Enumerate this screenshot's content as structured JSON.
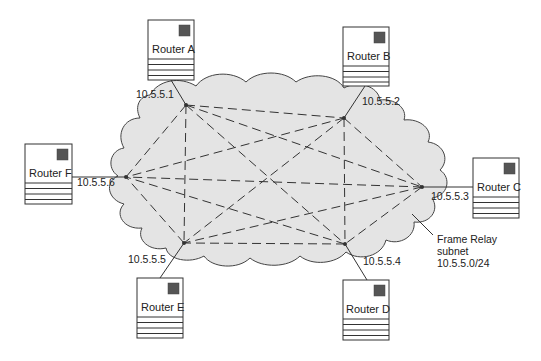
{
  "diagram": {
    "type": "frame-relay-full-mesh",
    "colors": {
      "cloud_fill": "#e4e4e4",
      "line": "#333333",
      "router_led": "#555555",
      "background": "#ffffff"
    },
    "cloud": {
      "label_line1": "Frame Relay",
      "label_line2": "subnet",
      "label_line3": "10.5.5.0/24"
    },
    "routers": [
      {
        "id": "A",
        "name": "Router A",
        "ip": "10.5.5.1"
      },
      {
        "id": "B",
        "name": "Router B",
        "ip": "10.5.5.2"
      },
      {
        "id": "C",
        "name": "Router C",
        "ip": "10.5.5.3"
      },
      {
        "id": "D",
        "name": "Router D",
        "ip": "10.5.5.4"
      },
      {
        "id": "E",
        "name": "Router E",
        "ip": "10.5.5.5"
      },
      {
        "id": "F",
        "name": "Router F",
        "ip": "10.5.5.6"
      }
    ],
    "pvcs": [
      [
        "A",
        "B"
      ],
      [
        "A",
        "C"
      ],
      [
        "A",
        "D"
      ],
      [
        "A",
        "E"
      ],
      [
        "A",
        "F"
      ],
      [
        "B",
        "C"
      ],
      [
        "B",
        "D"
      ],
      [
        "B",
        "E"
      ],
      [
        "B",
        "F"
      ],
      [
        "C",
        "D"
      ],
      [
        "C",
        "E"
      ],
      [
        "C",
        "F"
      ],
      [
        "D",
        "E"
      ],
      [
        "D",
        "F"
      ],
      [
        "E",
        "F"
      ]
    ]
  }
}
